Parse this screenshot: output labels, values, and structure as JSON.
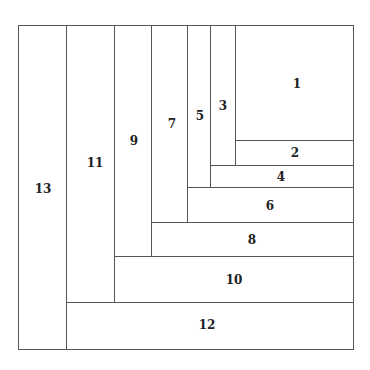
{
  "diagram": {
    "type": "fibonacci-style rectangle subdivision",
    "frame": {
      "x": 18,
      "y": 25,
      "w": 335,
      "h": 324
    },
    "line_color": "#555555",
    "cells": [
      {
        "label": "1",
        "x": 235,
        "y": 25,
        "w": 118,
        "h": 115,
        "lx": 297,
        "ly": 84
      },
      {
        "label": "2",
        "x": 235,
        "y": 140,
        "w": 118,
        "h": 25,
        "lx": 295,
        "ly": 153
      },
      {
        "label": "3",
        "x": 210,
        "y": 25,
        "w": 25,
        "h": 140,
        "lx": 223,
        "ly": 106
      },
      {
        "label": "4",
        "x": 210,
        "y": 165,
        "w": 143,
        "h": 22,
        "lx": 281,
        "ly": 177
      },
      {
        "label": "5",
        "x": 187,
        "y": 25,
        "w": 23,
        "h": 162,
        "lx": 200,
        "ly": 116
      },
      {
        "label": "6",
        "x": 187,
        "y": 187,
        "w": 166,
        "h": 35,
        "lx": 270,
        "ly": 206
      },
      {
        "label": "7",
        "x": 151,
        "y": 25,
        "w": 36,
        "h": 197,
        "lx": 172,
        "ly": 124
      },
      {
        "label": "8",
        "x": 151,
        "y": 222,
        "w": 202,
        "h": 34,
        "lx": 252,
        "ly": 240
      },
      {
        "label": "9",
        "x": 114,
        "y": 25,
        "w": 37,
        "h": 231,
        "lx": 134,
        "ly": 141
      },
      {
        "label": "10",
        "x": 114,
        "y": 256,
        "w": 239,
        "h": 46,
        "lx": 234,
        "ly": 280
      },
      {
        "label": "11",
        "x": 66,
        "y": 25,
        "w": 48,
        "h": 277,
        "lx": 95,
        "ly": 163
      },
      {
        "label": "12",
        "x": 66,
        "y": 302,
        "w": 287,
        "h": 47,
        "lx": 207,
        "ly": 325
      },
      {
        "label": "13",
        "x": 18,
        "y": 25,
        "w": 48,
        "h": 324,
        "lx": 43,
        "ly": 189
      }
    ]
  }
}
